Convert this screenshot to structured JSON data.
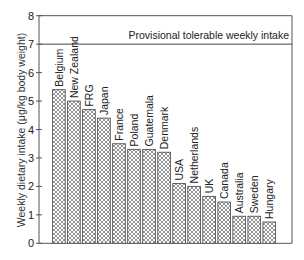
{
  "chart_data": {
    "type": "bar",
    "title": "",
    "xlabel": "",
    "ylabel": "Weekly dietary intake (μg/kg body weight)",
    "ylim": [
      0,
      8
    ],
    "yticks": [
      0,
      1,
      2,
      3,
      4,
      5,
      6,
      7,
      8
    ],
    "grid": false,
    "legend": null,
    "categories": [
      "Belgium",
      "New Zealand",
      "FRG",
      "Japan",
      "France",
      "Poland",
      "Guatemala",
      "Denmark",
      "USA",
      "Netherlands",
      "UK",
      "Canada",
      "Australia",
      "Sweden",
      "Hungary"
    ],
    "values": [
      5.4,
      5.0,
      4.7,
      4.4,
      3.5,
      3.3,
      3.3,
      3.2,
      2.1,
      2.0,
      1.65,
      1.45,
      0.95,
      0.95,
      0.75
    ],
    "reference_line": {
      "value": 7,
      "label": "Provisional tolerable weekly intake"
    },
    "bar_fill": "crosshatch",
    "colors": {
      "axis": "#444444",
      "bar_stroke": "#555555",
      "hatch": "#777777",
      "text": "#222222"
    }
  }
}
